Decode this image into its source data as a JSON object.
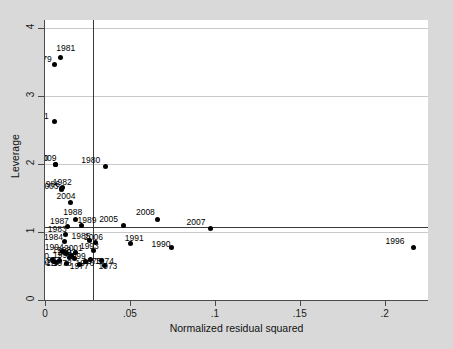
{
  "chart_data": {
    "type": "scatter",
    "title": "",
    "xlabel": "Normalized residual squared",
    "ylabel": "Leverage",
    "xlim": [
      0,
      0.2255
    ],
    "ylim": [
      0,
      4.12
    ],
    "xticks": [
      0,
      0.05,
      0.1,
      0.15,
      0.2
    ],
    "xticklabels": [
      "0",
      ".05",
      ".1",
      ".15",
      ".2"
    ],
    "yticks": [
      0,
      1,
      2,
      3,
      4
    ],
    "yticklabels": [
      "0",
      "1",
      "2",
      "3",
      "4"
    ],
    "grid": "horizontal",
    "legend": "none",
    "reference_lines": {
      "horizontal_leverage_mean": 1.08,
      "vertical_residual_mean": 0.0285
    },
    "point_label_field": "year",
    "points": [
      {
        "year": "1981",
        "x": 0.009,
        "y": 3.575,
        "lx": -4,
        "ly": -13
      },
      {
        "year": "1979",
        "x": 0.0058,
        "y": 3.46,
        "lx": -22,
        "ly": -10
      },
      {
        "year": "2011",
        "x": 0.0055,
        "y": 2.62,
        "lx": -24,
        "ly": -10
      },
      {
        "year": "2010",
        "x": 0.0062,
        "y": 2.0,
        "lx": -26,
        "ly": -10
      },
      {
        "year": "2009",
        "x": 0.0062,
        "y": 2.0,
        "lx": -18,
        "ly": -10
      },
      {
        "year": "1980",
        "x": 0.0355,
        "y": 1.965,
        "lx": -24,
        "ly": -10
      },
      {
        "year": "1982",
        "x": 0.0105,
        "y": 1.655,
        "lx": -10,
        "ly": -10
      },
      {
        "year": "1986",
        "x": 0.0095,
        "y": 1.64,
        "lx": -20,
        "ly": -9
      },
      {
        "year": "2003",
        "x": 0.0098,
        "y": 1.62,
        "lx": -22,
        "ly": -8
      },
      {
        "year": "2004",
        "x": 0.015,
        "y": 1.43,
        "lx": -14,
        "ly": -11
      },
      {
        "year": "2008",
        "x": 0.0665,
        "y": 1.185,
        "lx": -22,
        "ly": -11
      },
      {
        "year": "2005",
        "x": 0.046,
        "y": 1.09,
        "lx": -24,
        "ly": -11
      },
      {
        "year": "2007",
        "x": 0.0975,
        "y": 1.045,
        "lx": -24,
        "ly": -11
      },
      {
        "year": "1988",
        "x": 0.0178,
        "y": 1.19,
        "lx": -12,
        "ly": -11
      },
      {
        "year": "1989",
        "x": 0.0215,
        "y": 1.09,
        "lx": -4,
        "ly": -10
      },
      {
        "year": "1987",
        "x": 0.0135,
        "y": 1.075,
        "lx": -18,
        "ly": -10
      },
      {
        "year": "1983",
        "x": 0.0122,
        "y": 0.96,
        "lx": -18,
        "ly": -10
      },
      {
        "year": "1984",
        "x": 0.0112,
        "y": 0.855,
        "lx": -20,
        "ly": -9
      },
      {
        "year": "1985",
        "x": 0.0262,
        "y": 0.87,
        "lx": -18,
        "ly": -9
      },
      {
        "year": "2006",
        "x": 0.03,
        "y": 0.845,
        "lx": -12,
        "ly": -10
      },
      {
        "year": "1991",
        "x": 0.0505,
        "y": 0.825,
        "lx": -6,
        "ly": -10
      },
      {
        "year": "1990",
        "x": 0.0745,
        "y": 0.77,
        "lx": -20,
        "ly": -8
      },
      {
        "year": "1996",
        "x": 0.217,
        "y": 0.775,
        "lx": -28,
        "ly": -10
      },
      {
        "year": "1993",
        "x": 0.0288,
        "y": 0.735,
        "lx": -14,
        "ly": -8
      },
      {
        "year": "2001",
        "x": 0.0182,
        "y": 0.7,
        "lx": -12,
        "ly": -8
      },
      {
        "year": "1994",
        "x": 0.0105,
        "y": 0.72,
        "lx": -18,
        "ly": -8
      },
      {
        "year": "1998",
        "x": 0.0125,
        "y": 0.69,
        "lx": -14,
        "ly": -7
      },
      {
        "year": "1992",
        "x": 0.0155,
        "y": 0.66,
        "lx": -14,
        "ly": -7
      },
      {
        "year": "1995",
        "x": 0.0142,
        "y": 0.63,
        "lx": -16,
        "ly": -6
      },
      {
        "year": "1999",
        "x": 0.0175,
        "y": 0.615,
        "lx": -8,
        "ly": -6
      },
      {
        "year": "2000",
        "x": 0.0042,
        "y": 0.6,
        "lx": -22,
        "ly": -7
      },
      {
        "year": "2002",
        "x": 0.005,
        "y": 0.56,
        "lx": -22,
        "ly": -4
      },
      {
        "year": "1997",
        "x": 0.0088,
        "y": 0.575,
        "lx": -18,
        "ly": -5
      },
      {
        "year": "2012",
        "x": 0.0068,
        "y": 0.545,
        "lx": -20,
        "ly": -4
      },
      {
        "year": "1978",
        "x": 0.0128,
        "y": 0.54,
        "lx": -14,
        "ly": -4
      },
      {
        "year": "1977",
        "x": 0.0205,
        "y": 0.52,
        "lx": -10,
        "ly": -3
      },
      {
        "year": "1976",
        "x": 0.0238,
        "y": 0.56,
        "lx": -10,
        "ly": -3
      },
      {
        "year": "1975",
        "x": 0.0268,
        "y": 0.59,
        "lx": -8,
        "ly": -3
      },
      {
        "year": "1974",
        "x": 0.033,
        "y": 0.585,
        "lx": -6,
        "ly": -3
      },
      {
        "year": "1973",
        "x": 0.035,
        "y": 0.515,
        "lx": -6,
        "ly": -3
      }
    ]
  },
  "figure": {
    "background_color": "#d9d9d9",
    "plot_background_color": "#ffffff",
    "point_color": "#000000",
    "gridline_color": "#c9c9c9",
    "reference_line_color": "#3a3a3a"
  }
}
